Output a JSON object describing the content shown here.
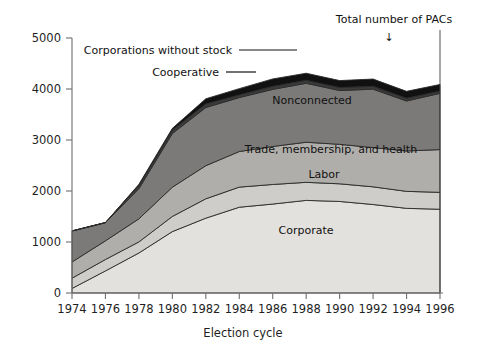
{
  "chart_data": {
    "type": "area",
    "title": "",
    "xlabel": "Election cycle",
    "ylabel": "",
    "stacked": true,
    "grid": false,
    "legend_position": "inline-band-labels",
    "xlim": [
      1974,
      1996
    ],
    "ylim": [
      0,
      5000
    ],
    "ytick_labels": [
      "0",
      "1000",
      "2000",
      "3000",
      "4000",
      "5000"
    ],
    "yticks": [
      0,
      1000,
      2000,
      3000,
      4000,
      5000
    ],
    "xtick_labels": [
      "1974",
      "1976",
      "1978",
      "1980",
      "1982",
      "1984",
      "1986",
      "1988",
      "1990",
      "1992",
      "1994",
      "1996"
    ],
    "x": [
      1974,
      1976,
      1978,
      1980,
      1982,
      1984,
      1986,
      1988,
      1990,
      1992,
      1994,
      1996
    ],
    "series": [
      {
        "name": "Corporate",
        "label": "Corporate",
        "color": "#e3e1dd",
        "values": [
          89,
          433,
          785,
          1204,
          1467,
          1682,
          1744,
          1816,
          1795,
          1735,
          1660,
          1642
        ]
      },
      {
        "name": "Labor",
        "label": "Labor",
        "color": "#cfcdc9",
        "values": [
          201,
          224,
          217,
          297,
          380,
          394,
          384,
          354,
          346,
          347,
          333,
          332
        ]
      },
      {
        "name": "Trade, membership, and health",
        "label": "Trade, membership, and health",
        "color": "#b0aeaa",
        "values": [
          318,
          366,
          453,
          574,
          649,
          698,
          745,
          786,
          774,
          770,
          792,
          838
        ]
      },
      {
        "name": "Nonconnected",
        "label": "Nonconnected",
        "color": "#7b7a78",
        "values": [
          608,
          357,
          592,
          1053,
          1141,
          1058,
          1120,
          1156,
          1055,
          1145,
          980,
          1103
        ]
      },
      {
        "name": "Cooperative",
        "label": "Cooperative",
        "color": "#3a3a3a",
        "values": [
          0,
          0,
          65,
          67,
          71,
          52,
          59,
          59,
          59,
          56,
          53,
          44
        ]
      },
      {
        "name": "Corporations without stock",
        "label": "Corporations without stock",
        "color": "#111111",
        "values": [
          0,
          0,
          18,
          33,
          100,
          123,
          145,
          138,
          136,
          142,
          136,
          130
        ]
      }
    ],
    "totals": [
      1216,
      1380,
      2130,
      3228,
      3808,
      4007,
      4197,
      4309,
      4165,
      4195,
      3954,
      4089
    ],
    "annotations": [
      {
        "name": "total-pacs-annotation",
        "text": "Total number of PACs",
        "marker": "arrow-down",
        "points_to_x": 1992
      },
      {
        "name": "corporations-without-stock-callout",
        "text": "Corporations without stock",
        "marker": "leader-line"
      },
      {
        "name": "cooperative-callout",
        "text": "Cooperative",
        "marker": "leader-line"
      }
    ]
  },
  "axes": {
    "x_axis_title": "Election cycle",
    "y_axis_title": ""
  },
  "icons": {
    "arrow_down": "↓"
  }
}
